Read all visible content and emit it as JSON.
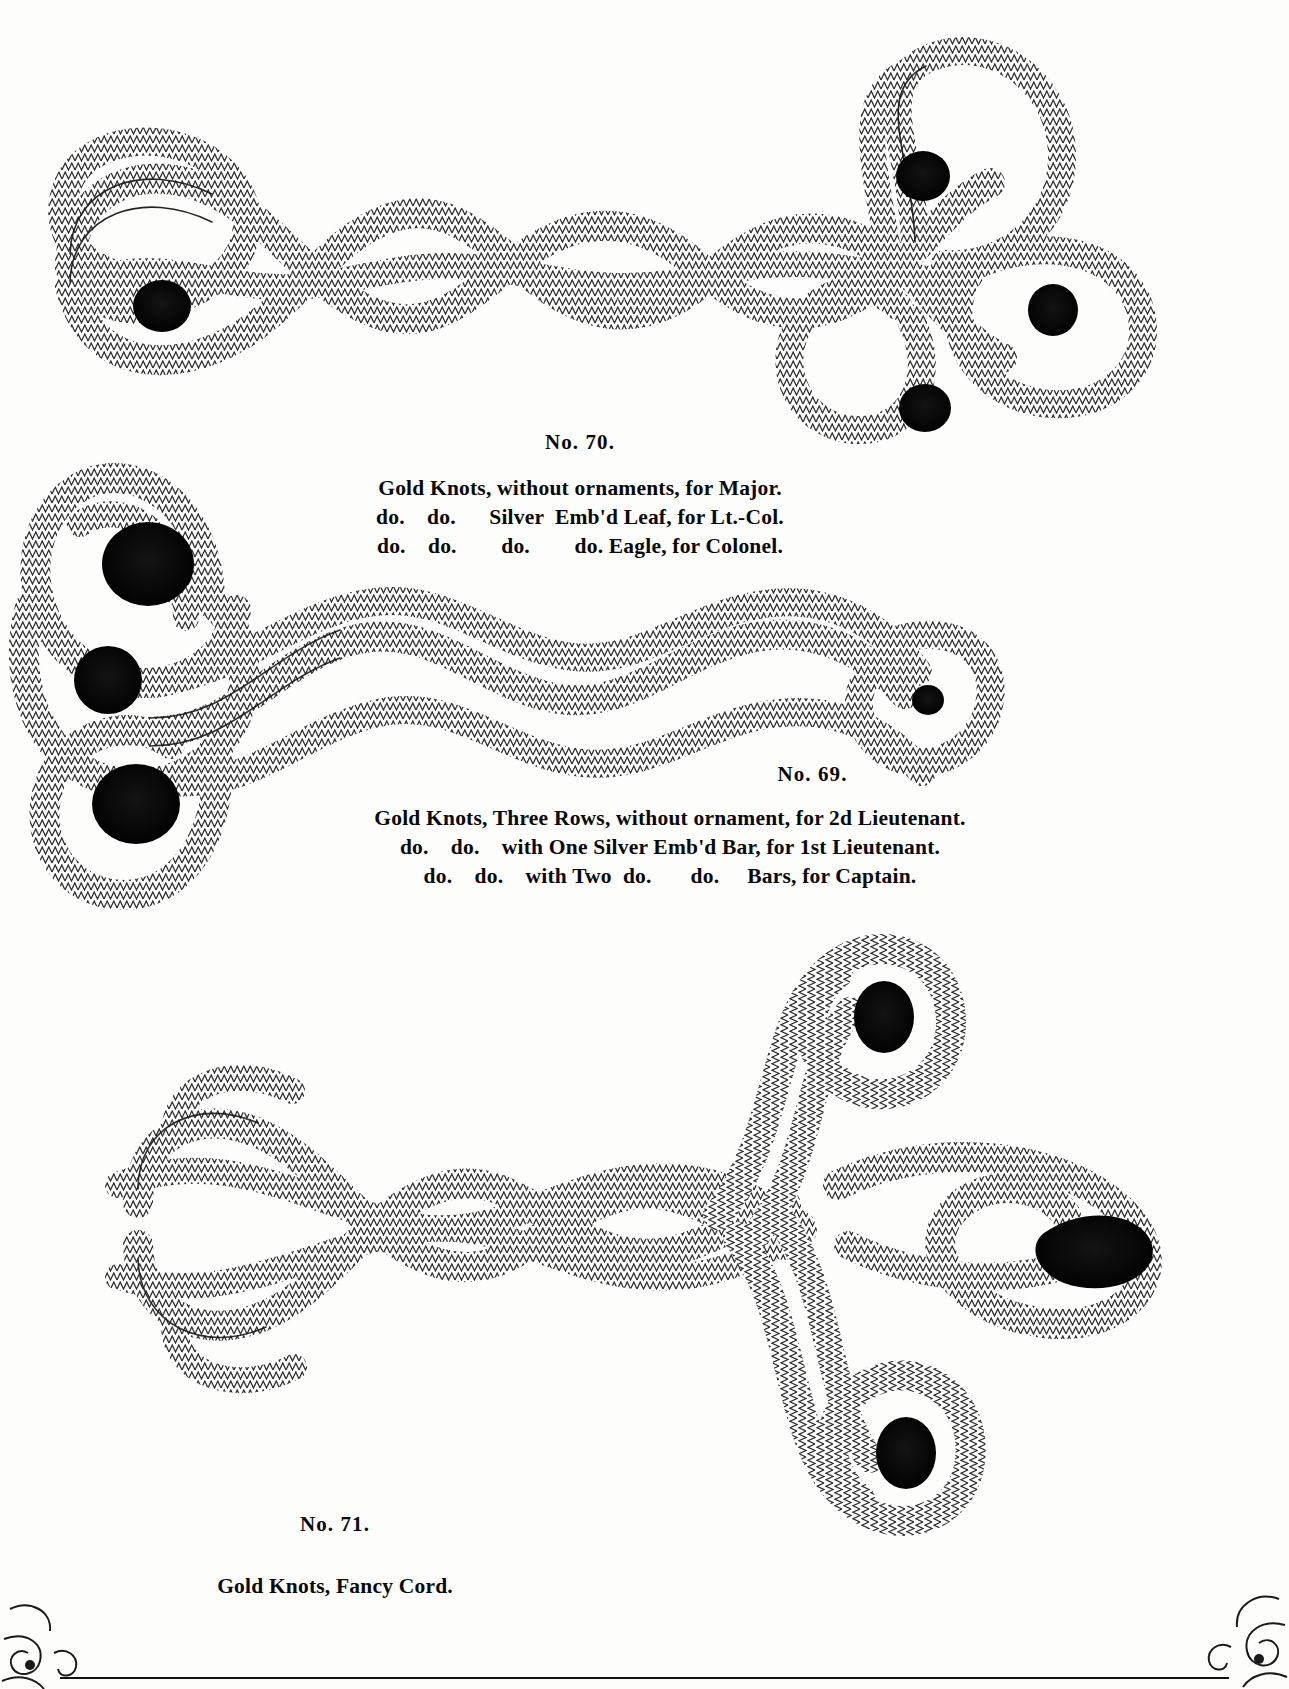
{
  "page": {
    "background_color": "#fdfdfb",
    "ink_color": "#0b0b0b",
    "kind": "engraved-catalog-plate"
  },
  "plates": [
    {
      "id": "plate-70",
      "number_label": "No.  70.",
      "caption_lines": [
        "Gold Knots, without ornaments, for Major.",
        "do.    do.      Silver  Emb'd Leaf, for Lt.-Col.",
        "do.    do.        do.        do. Eagle, for Colonel."
      ],
      "figure": {
        "description": "horizontal four-loop braided gold knot with trefoil cluster at right end",
        "loops": 4,
        "cord_rows": 3,
        "eyes": 4
      }
    },
    {
      "id": "plate-69",
      "number_label": "No. 69.",
      "caption_lines": [
        "Gold Knots, Three Rows, without ornament, for 2d Lieutenant.",
        "do.    do.    with One Silver Emb'd Bar, for 1st Lieutenant.",
        "do.    do.    with Two  do.       do.     Bars, for Captain."
      ],
      "figure": {
        "description": "horizontal three-row braided gold knot with double loop cluster at left end",
        "loops": 4,
        "cord_rows": 3,
        "eyes": 3
      }
    },
    {
      "id": "plate-71",
      "number_label": "No. 71.",
      "caption_lines": [
        "Gold Knots, Fancy Cord."
      ],
      "figure": {
        "description": "interlaced fancy cord knot with woven lattice body and cross-shaped looped terminal at right",
        "loops": 4,
        "cord_rows": 4,
        "eyes": 3
      }
    }
  ],
  "ornaments": {
    "corner_bottom_left": "scroll-flourish",
    "corner_bottom_right": "scroll-flourish",
    "bottom_rule": "horizontal-rule"
  }
}
